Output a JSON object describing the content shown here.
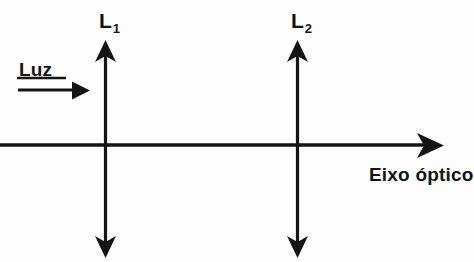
{
  "diagram": {
    "background_color": "#fdfdfd",
    "stroke_color": "#141414",
    "labels": {
      "lens1": "L",
      "lens1_subscript": "1",
      "lens2": "L",
      "lens2_subscript": "2",
      "light": "Luz",
      "axis": "Eixo óptico"
    },
    "geometry": {
      "axis": {
        "x_start": 0,
        "x_end": 443,
        "y": 145,
        "arrowhead": "right-open-chevron"
      },
      "light_ray": {
        "x_start": 18,
        "x_end": 88,
        "y": 90,
        "arrowhead": "right-solid-triangle"
      },
      "lens1": {
        "x": 105,
        "y_top": 42,
        "y_bottom": 256,
        "arrowheads": "both-solid-triangle"
      },
      "lens2": {
        "x": 297,
        "y_top": 42,
        "y_bottom": 256,
        "arrowheads": "both-solid-triangle"
      }
    }
  }
}
